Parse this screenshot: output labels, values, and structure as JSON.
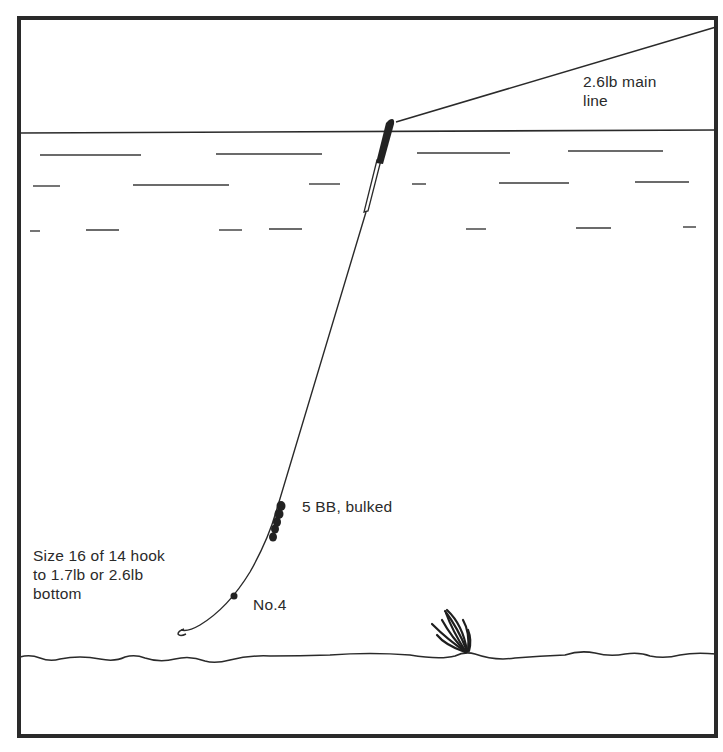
{
  "diagram": {
    "type": "fishing-rig-illustration",
    "labels": {
      "main_line": "2.6lb main\nline",
      "shot_bulk": "5 BB, bulked",
      "hook": "Size 16 of 14 hook\nto 1.7lb or 2.6lb\nbottom",
      "dropper_shot": "No.4"
    },
    "components": [
      {
        "name": "main-line",
        "description": "2.6lb main line from rod tip to float"
      },
      {
        "name": "float",
        "description": "Waggler float at water surface, dark tip"
      },
      {
        "name": "bulk-shot",
        "description": "5 BB shot bulked on line"
      },
      {
        "name": "dropper-shot",
        "description": "No.4 shot near hook"
      },
      {
        "name": "hook",
        "description": "Size 16 or 14 hook near bottom"
      },
      {
        "name": "weed",
        "description": "Weed clump on lake bed"
      },
      {
        "name": "water-surface"
      },
      {
        "name": "lake-bed"
      }
    ],
    "colors": {
      "ink": "#2a2a2a",
      "background": "#ffffff"
    }
  }
}
